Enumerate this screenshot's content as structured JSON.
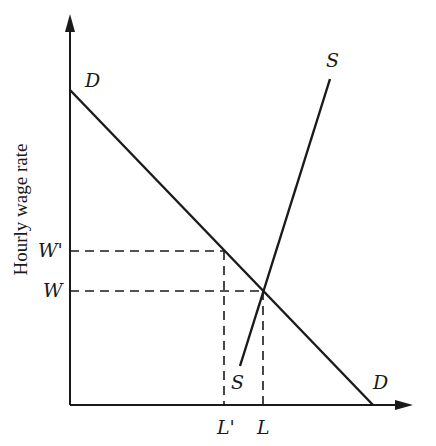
{
  "diagram": {
    "type": "supply-demand labor market",
    "y_axis_title": "Hourly wage rate",
    "x_axis_title": "",
    "curves": {
      "demand": {
        "label_top": "D",
        "label_bottom": "D",
        "from": [
          70,
          90
        ],
        "to": [
          373,
          405
        ]
      },
      "supply": {
        "label_top": "S",
        "label_bottom": "S",
        "from": [
          240,
          366
        ],
        "to": [
          330,
          79
        ]
      }
    },
    "y_ticks": [
      {
        "label": "W'",
        "y": 251
      },
      {
        "label": "W",
        "y": 291
      }
    ],
    "x_ticks": [
      {
        "label": "L'",
        "x": 224
      },
      {
        "label": "L",
        "x": 263
      }
    ],
    "equilibrium": {
      "x": 263,
      "y": 291
    },
    "colors": {
      "line": "#1a1a1a",
      "background": "#ffffff"
    }
  }
}
